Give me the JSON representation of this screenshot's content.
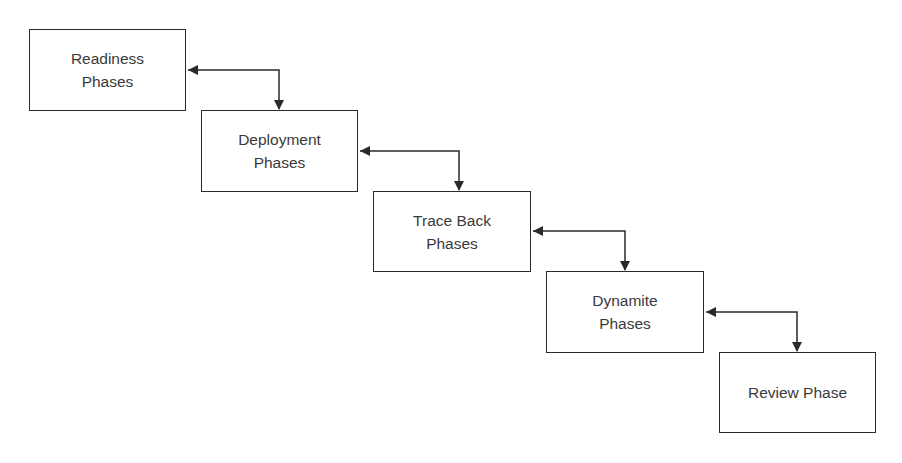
{
  "diagram": {
    "type": "waterfall-flow",
    "colors": {
      "stroke": "#2a2a2a",
      "text": "#3a3a3a",
      "background": "#ffffff"
    },
    "nodes": [
      {
        "id": "readiness",
        "label": "Readiness\nPhases",
        "x": 29,
        "y": 29,
        "w": 157,
        "h": 82
      },
      {
        "id": "deployment",
        "label": "Deployment\nPhases",
        "x": 201,
        "y": 110,
        "w": 157,
        "h": 82
      },
      {
        "id": "traceback",
        "label": "Trace Back\nPhases",
        "x": 373,
        "y": 191,
        "w": 158,
        "h": 81
      },
      {
        "id": "dynamite",
        "label": "Dynamite\nPhases",
        "x": 546,
        "y": 271,
        "w": 158,
        "h": 82
      },
      {
        "id": "review",
        "label": "Review Phase",
        "x": 719,
        "y": 352,
        "w": 157,
        "h": 81
      }
    ],
    "edges": [
      {
        "from": "readiness",
        "to": "deployment",
        "bidirectional": true
      },
      {
        "from": "deployment",
        "to": "traceback",
        "bidirectional": true
      },
      {
        "from": "traceback",
        "to": "dynamite",
        "bidirectional": true
      },
      {
        "from": "dynamite",
        "to": "review",
        "bidirectional": true
      }
    ]
  }
}
